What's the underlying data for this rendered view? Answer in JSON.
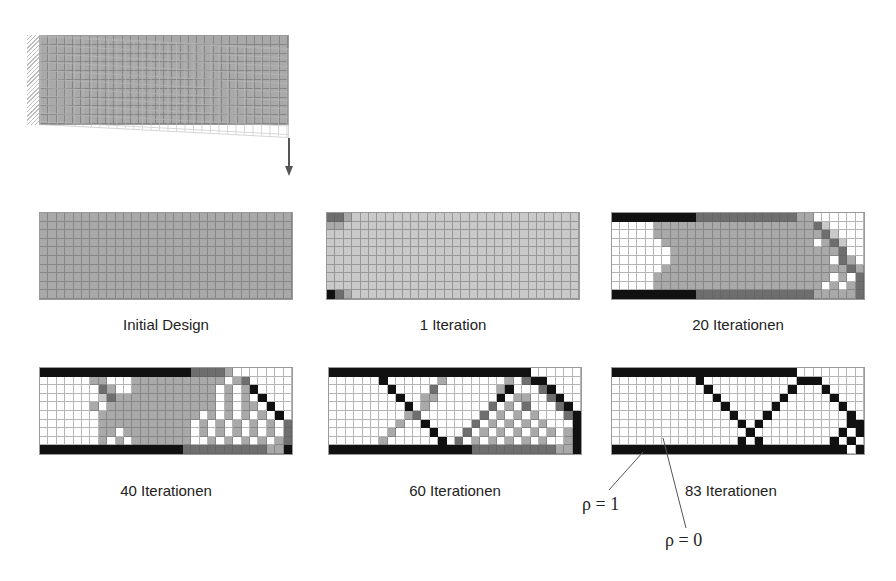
{
  "figure": {
    "top_model": {
      "label": "",
      "load_arrow": "downward force at free end",
      "support": "clamped left edge (hatched)"
    },
    "panels": [
      {
        "id": "initial",
        "caption": "Initial Design",
        "rows": [
          "222222222222222222222222222222",
          "222222222222222222222222222222",
          "222222222222222222222222222222",
          "222222222222222222222222222222",
          "222222222222222222222222222222",
          "222222222222222222222222222222",
          "222222222222222222222222222222",
          "222222222222222222222222222222",
          "222222222222222222222222222222",
          "222222222222222222222222222222"
        ]
      },
      {
        "id": "iter1",
        "caption": "1 Iteration",
        "rows": [
          "332111111111111111111111111111",
          "221111111111111111111111111111",
          "111111111111111111111111111111",
          "111111111111111111111111111111",
          "111111111111111111111111111111",
          "111111111111111111111111111111",
          "111111111111111111111111111111",
          "111111111111111111111111111111",
          "111111111111111111111111111111",
          "432111111111111111111111111111"
        ]
      },
      {
        "id": "iter20",
        "caption": "20 Iterationen",
        "rows": [
          "444444444433333333333322000000",
          "000002222222222222222222310000",
          "000002222222222222222222231000",
          "000000222222222222222222023100",
          "000000022222222222222222222300",
          "000000022222222222222222220320",
          "000000222222222222222222222232",
          "000002222222222222222222220203",
          "000002222222222222222222202023",
          "444444444433333333333333222223"
        ]
      },
      {
        "id": "iter40",
        "caption": "40 Iterationen",
        "rows": [
          "444444444444444444333320000000",
          "000000220002222222222202300000",
          "000000032002222222222020240000",
          "000000013222222222222020204000",
          "000000202222222222222020220400",
          "000000022222222222202020202040",
          "000000022222222222020202020203",
          "000000022022222222020202020203",
          "000000020202222222002020202023",
          "444444444444444443333333333224"
        ]
      },
      {
        "id": "iter60",
        "caption": "60 Iterationen",
        "rows": [
          "444444444444444444444444000000",
          "000000400000020000000203440000",
          "000000040000300000002400034000",
          "000000004002200000004022003400",
          "000000000402000000030203000340",
          "000000000230000000302020200034",
          "000000002004000003020202020004",
          "000000020000400030202020202024",
          "000000200000040302020202020024",
          "444444444444444443333333333224"
        ]
      },
      {
        "id": "iter83",
        "caption": "83 Iterationen",
        "rows": [
          "444444444444444444444400000000",
          "000000000040000000000044400000",
          "000000000004000000000400040000",
          "000000000000400000004000004000",
          "000000000000040000040000000400",
          "000000000000004000400000000040",
          "000000000000000404000000000044",
          "000000000000000040000000000404",
          "000000000000000404000000004040",
          "444444444444444444444444444404"
        ]
      }
    ],
    "annotations": {
      "rho_one": "ρ = 1",
      "rho_zero": "ρ = 0"
    },
    "shade_legend": {
      "0": "#ffffff",
      "1": "#c9c9c9",
      "2": "#a9a9a9",
      "3": "#6e6e6e",
      "4": "#111111"
    }
  }
}
